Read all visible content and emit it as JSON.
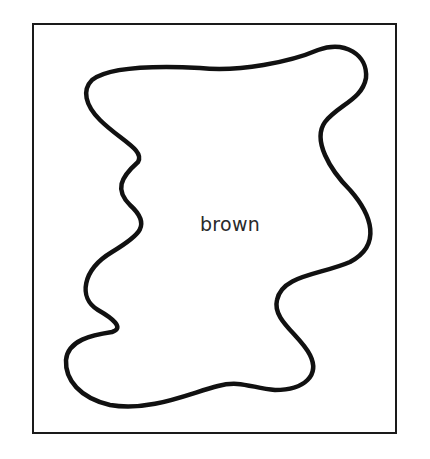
{
  "figure": {
    "shape": "irregular-blob-outline",
    "label": "brown",
    "colors": {
      "background": "#ffffff",
      "stroke": "#111111",
      "frame": "#1a1a1a",
      "text": "#2a2a2a"
    }
  }
}
